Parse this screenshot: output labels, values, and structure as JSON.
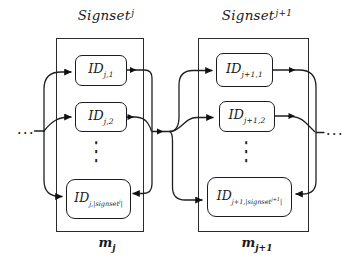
{
  "signsets": {
    "left": {
      "title": {
        "base": "Signset",
        "sup": "j"
      },
      "items": [
        {
          "base": "ID",
          "sub": "j,1"
        },
        {
          "base": "ID",
          "sub": "j,2"
        },
        {
          "base": "ID",
          "sub_pre": "j,|signset",
          "sub_sup": "j",
          "sub_post": "|"
        }
      ],
      "vdots": "⋮",
      "message_label": {
        "base": "m",
        "sub": "j"
      }
    },
    "right": {
      "title": {
        "base": "Signset",
        "sup": "j+1"
      },
      "items": [
        {
          "base": "ID",
          "sub": "j+1,1"
        },
        {
          "base": "ID",
          "sub": "j+1,2"
        },
        {
          "base": "ID",
          "sub_pre": "j+1,|signset",
          "sub_sup": "j+1",
          "sub_post": "|"
        }
      ],
      "vdots": "⋮",
      "message_label": {
        "base": "m",
        "sub": "j+1"
      }
    }
  },
  "ellipsis": {
    "left": "...",
    "right": "..."
  },
  "colors": {
    "ink": "#1a1a1a",
    "background": "#ffffff"
  }
}
